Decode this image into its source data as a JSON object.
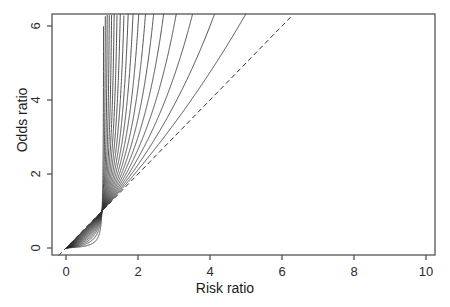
{
  "chart_data": {
    "type": "line",
    "title": "",
    "xlabel": "Risk ratio",
    "ylabel": "Odds ratio",
    "xlim": [
      -0.55,
      10.6
    ],
    "ylim": [
      -0.35,
      6.45
    ],
    "xticks": [
      0,
      2,
      4,
      6,
      8,
      10
    ],
    "yticks": [
      0,
      2,
      4,
      6
    ],
    "xtick_labels": [
      "0",
      "2",
      "4",
      "6",
      "8",
      "10"
    ],
    "ytick_labels": [
      "0",
      "2",
      "4",
      "6"
    ],
    "grid": false,
    "legend": null,
    "box": "full-rectangle",
    "annotations": [],
    "reference_line": {
      "name": "identity-line",
      "style": "dashed",
      "equation": "OR = RR",
      "from": [
        -0.2,
        -0.2
      ],
      "to": [
        6.3,
        6.3
      ],
      "color": "#333333"
    },
    "series_description": "Family of curves OR = RR*(1-p0)/(1-p0*RR), all passing through (1,1); each curve is a different baseline risk p0. Curves fan upward from the identity line and are clipped at the plot box.",
    "convergence_point": [
      1,
      1
    ],
    "series": [
      {
        "name": "p0 = 0.05",
        "p0": 0.05,
        "values": []
      },
      {
        "name": "p0 = 0.10",
        "p0": 0.1,
        "values": []
      },
      {
        "name": "p0 = 0.15",
        "p0": 0.15,
        "values": []
      },
      {
        "name": "p0 = 0.20",
        "p0": 0.2,
        "values": []
      },
      {
        "name": "p0 = 0.25",
        "p0": 0.25,
        "values": []
      },
      {
        "name": "p0 = 0.30",
        "p0": 0.3,
        "values": []
      },
      {
        "name": "p0 = 0.35",
        "p0": 0.35,
        "values": []
      },
      {
        "name": "p0 = 0.40",
        "p0": 0.4,
        "values": []
      },
      {
        "name": "p0 = 0.45",
        "p0": 0.45,
        "values": []
      },
      {
        "name": "p0 = 0.50",
        "p0": 0.5,
        "values": []
      },
      {
        "name": "p0 = 0.55",
        "p0": 0.55,
        "values": []
      },
      {
        "name": "p0 = 0.60",
        "p0": 0.6,
        "values": []
      },
      {
        "name": "p0 = 0.65",
        "p0": 0.65,
        "values": []
      },
      {
        "name": "p0 = 0.70",
        "p0": 0.7,
        "values": []
      },
      {
        "name": "p0 = 0.75",
        "p0": 0.75,
        "values": []
      },
      {
        "name": "p0 = 0.80",
        "p0": 0.8,
        "values": []
      },
      {
        "name": "p0 = 0.85",
        "p0": 0.85,
        "values": []
      },
      {
        "name": "p0 = 0.90",
        "p0": 0.9,
        "values": []
      },
      {
        "name": "p0 = 0.95",
        "p0": 0.95,
        "values": []
      }
    ],
    "colors": {
      "line": "#333333",
      "axis": "#555555",
      "text": "#1a1a1a",
      "background": "#ffffff"
    }
  }
}
